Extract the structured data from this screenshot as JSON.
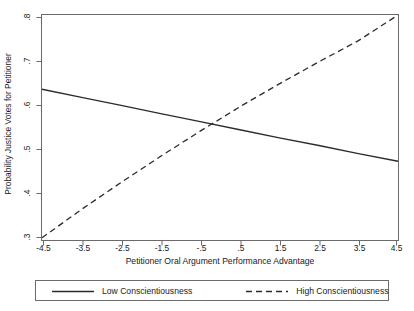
{
  "chart_data": {
    "type": "line",
    "title": "",
    "xlabel": "Petitioner Oral Argument Performance Advantage",
    "ylabel": "Probability Justice Votes for Petitioner",
    "xlim": [
      -4.5,
      4.5
    ],
    "ylim": [
      0.3,
      0.8
    ],
    "xticks": [
      -4.5,
      -3.5,
      -2.5,
      -1.5,
      -0.5,
      0.5,
      1.5,
      2.5,
      3.5,
      4.5
    ],
    "xticklabels": [
      "-4.5",
      "-3.5",
      "-2.5",
      "-1.5",
      "-.5",
      ".5",
      "1.5",
      "2.5",
      "3.5",
      "4.5"
    ],
    "yticks": [
      0.3,
      0.4,
      0.5,
      0.6,
      0.7,
      0.8
    ],
    "yticklabels": [
      ".3",
      ".4",
      ".5",
      ".6",
      ".7",
      ".8"
    ],
    "grid": false,
    "legend_position": "below",
    "x": [
      -4.5,
      -3.5,
      -2.5,
      -1.5,
      -0.5,
      0.5,
      1.5,
      2.5,
      3.5,
      4.5
    ],
    "series": [
      {
        "name": "Low Conscientiousness",
        "style": "solid",
        "color": "#2b2b2b",
        "values": [
          0.635,
          0.617,
          0.599,
          0.581,
          0.563,
          0.545,
          0.527,
          0.51,
          0.492,
          0.475
        ]
      },
      {
        "name": "High Conscientiousness",
        "style": "dashed",
        "color": "#2b2b2b",
        "values": [
          0.305,
          0.368,
          0.428,
          0.486,
          0.542,
          0.596,
          0.647,
          0.696,
          0.743,
          0.8
        ]
      }
    ]
  },
  "axis": {
    "ylabel": "Probability Justice Votes for Petitioner",
    "xlabel": "Petitioner Oral Argument Performance Advantage",
    "yticklabels": [
      ".8",
      ".7",
      ".6",
      ".5",
      ".4",
      ".3"
    ],
    "xticklabels": [
      "-4.5",
      "-3.5",
      "-2.5",
      "-1.5",
      "-.5",
      ".5",
      "1.5",
      "2.5",
      "3.5",
      "4.5"
    ]
  },
  "legend": {
    "entries": [
      {
        "label": "Low Conscientiousness",
        "style": "solid"
      },
      {
        "label": "High Conscientiousness",
        "style": "dashed"
      }
    ]
  },
  "colors": {
    "line": "#2b2b2b",
    "axis": "#6b6b6b",
    "background": "#ffffff",
    "text": "#1a1a1a"
  }
}
